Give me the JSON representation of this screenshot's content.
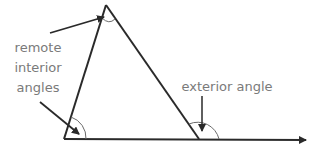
{
  "diagram": {
    "colors": {
      "stroke": "#2a2a2a",
      "label": "#7a7a7a",
      "arc": "#6a6a6a"
    },
    "labels": {
      "remote_line1": "remote",
      "remote_line2": "interior",
      "remote_line3": "angles",
      "exterior": "exterior angle"
    },
    "triangle": {
      "apex": [
        106,
        5
      ],
      "bottom_left": [
        64,
        139
      ],
      "bottom_right": [
        199,
        139
      ],
      "baseline_end": [
        306,
        140
      ]
    }
  }
}
